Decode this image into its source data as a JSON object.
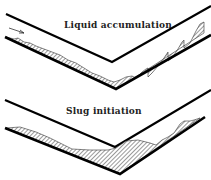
{
  "panels": [
    {
      "title": "Liquid accumulation"
    },
    {
      "title": "Slug initiation"
    }
  ],
  "flow_arrow": "flow-direction-arrow",
  "colors": {
    "pipe": "#000000",
    "liquid_hatch": "#444444",
    "background": "#ffffff"
  }
}
